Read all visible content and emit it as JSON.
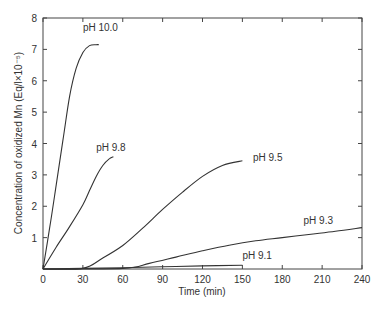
{
  "chart_data": {
    "type": "line",
    "title": "",
    "xlabel": "Time (min)",
    "ylabel": "Concentration of oxidized Mn (Eq/l×10⁻⁵)",
    "xlim": [
      0,
      240
    ],
    "ylim": [
      0,
      8
    ],
    "xticks": [
      0,
      30,
      60,
      90,
      120,
      150,
      180,
      210,
      240
    ],
    "yticks": [
      1,
      2,
      3,
      4,
      5,
      6,
      7,
      8
    ],
    "grid": false,
    "legend": "inline labels",
    "series": [
      {
        "name": "pH 10.0",
        "x": [
          0,
          5,
          10,
          15,
          20,
          25,
          30,
          35,
          40,
          42
        ],
        "values": [
          0,
          1.3,
          2.7,
          4.1,
          5.5,
          6.4,
          6.9,
          7.12,
          7.15,
          7.15
        ],
        "label_pos": [
          30,
          7.6
        ]
      },
      {
        "name": "pH 9.8",
        "x": [
          0,
          10,
          20,
          30,
          35,
          40,
          45,
          50,
          53
        ],
        "values": [
          0,
          0.7,
          1.35,
          2.05,
          2.5,
          2.95,
          3.3,
          3.52,
          3.58
        ],
        "label_pos": [
          40,
          3.75
        ]
      },
      {
        "name": "pH 9.5",
        "x": [
          0,
          30,
          45,
          60,
          75,
          90,
          105,
          120,
          135,
          150
        ],
        "values": [
          0,
          0.02,
          0.35,
          0.75,
          1.3,
          1.9,
          2.45,
          2.95,
          3.3,
          3.45
        ],
        "label_pos": [
          158,
          3.45
        ]
      },
      {
        "name": "pH 9.3",
        "x": [
          0,
          60,
          80,
          100,
          120,
          140,
          160,
          180,
          200,
          220,
          240
        ],
        "values": [
          0,
          0.02,
          0.18,
          0.38,
          0.58,
          0.76,
          0.9,
          1.0,
          1.1,
          1.2,
          1.32
        ],
        "label_pos": [
          196,
          1.45
        ]
      },
      {
        "name": "pH 9.1",
        "x": [
          0,
          30,
          60,
          90,
          120,
          150
        ],
        "values": [
          0,
          0.02,
          0.04,
          0.07,
          0.1,
          0.12
        ],
        "label_pos": [
          150,
          0.32
        ]
      }
    ]
  }
}
